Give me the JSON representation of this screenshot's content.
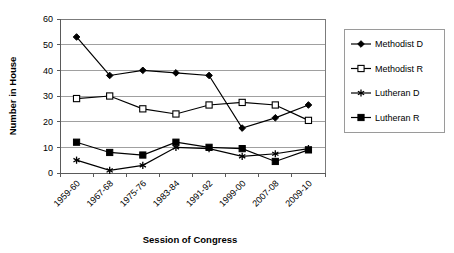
{
  "chart_data": {
    "type": "line",
    "title": "",
    "xlabel": "Session of Congress",
    "ylabel": "Number in House",
    "categories": [
      "1959-60",
      "1967-68",
      "1975-76",
      "1983-84",
      "1991-92",
      "1999-00",
      "2007-08",
      "2009-10"
    ],
    "ylim": [
      0,
      60
    ],
    "ytick_step": 10,
    "yticks": [
      "0",
      "10",
      "20",
      "30",
      "40",
      "50",
      "60"
    ],
    "grid": "horizontal",
    "legend_position": "right",
    "series": [
      {
        "name": "Methodist D",
        "marker": "filled-diamond",
        "values": [
          53,
          38,
          40,
          39,
          38,
          17.5,
          21.5,
          26.5
        ]
      },
      {
        "name": "Methodist R",
        "marker": "open-square",
        "values": [
          29,
          30,
          25,
          23,
          26.5,
          27.5,
          26.5,
          20.5
        ]
      },
      {
        "name": "Lutheran D",
        "marker": "asterisk",
        "values": [
          5,
          1,
          3,
          10,
          9.5,
          6.5,
          7.5,
          9.5
        ]
      },
      {
        "name": "Lutheran R",
        "marker": "filled-square",
        "values": [
          12,
          8,
          7,
          12,
          10,
          9.5,
          4.5,
          9
        ]
      }
    ]
  },
  "colors": {
    "series": "#000000",
    "gridline": "#a0a0a0",
    "frame": "#7b7b7b",
    "background": "#ffffff"
  }
}
